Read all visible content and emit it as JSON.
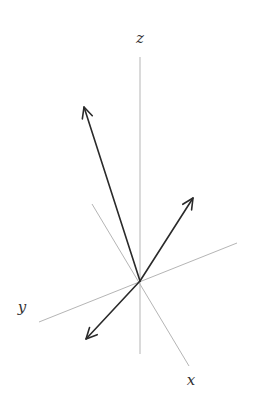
{
  "diagram": {
    "type": "3d-vector-diagram",
    "colors": {
      "axis": "#b5b5b5",
      "vector": "#2a2a2a",
      "label": "#333333"
    },
    "origin": [
      140,
      281
    ],
    "axes": [
      {
        "name": "z",
        "label": "z",
        "from": [
          140,
          57
        ],
        "to": [
          140,
          354
        ],
        "label_pos": [
          140,
          38
        ]
      },
      {
        "name": "x",
        "label": "x",
        "from": [
          92,
          204
        ],
        "to": [
          189,
          366
        ],
        "label_pos": [
          191,
          380
        ]
      },
      {
        "name": "y",
        "label": "y",
        "from": [
          39,
          322
        ],
        "to": [
          237,
          243
        ],
        "label_pos": [
          22,
          307
        ]
      }
    ],
    "vectors": [
      {
        "name": "vector-up-left",
        "tip": [
          84,
          107
        ]
      },
      {
        "name": "vector-up-right",
        "tip": [
          193,
          198
        ]
      },
      {
        "name": "vector-down-left",
        "tip": [
          86,
          339
        ]
      }
    ]
  }
}
